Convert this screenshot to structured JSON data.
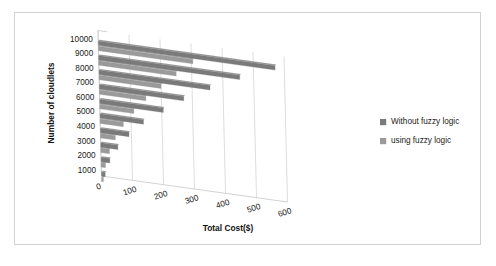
{
  "chart_data": {
    "type": "bar",
    "orientation": "horizontal",
    "style": "3d-perspective",
    "title": "",
    "xlabel": "Total Cost($)",
    "ylabel": "Number of cloudlets",
    "categories": [
      "1000",
      "2000",
      "3000",
      "4000",
      "5000",
      "6000",
      "7000",
      "8000",
      "9000",
      "10000"
    ],
    "xticks": [
      "0",
      "100",
      "200",
      "300",
      "400",
      "500",
      "600"
    ],
    "xlim": [
      0,
      600
    ],
    "grid": true,
    "legend_position": "right",
    "series": [
      {
        "name": "Without fuzzy logic",
        "color": "#7a7a7a",
        "values": [
          12,
          28,
          55,
          92,
          140,
          205,
          272,
          358,
          455,
          570
        ]
      },
      {
        "name": "using fuzzy logic",
        "color": "#9a9a9a",
        "values": [
          6,
          14,
          28,
          48,
          75,
          110,
          150,
          200,
          250,
          305
        ]
      }
    ]
  },
  "axes": {
    "y_title": "Number of cloudlets",
    "x_title": "Total Cost($)",
    "y_ticks": [
      "10000",
      "9000",
      "8000",
      "7000",
      "6000",
      "5000",
      "4000",
      "3000",
      "2000",
      "1000"
    ],
    "x_ticks": [
      "0",
      "100",
      "200",
      "300",
      "400",
      "500",
      "600"
    ]
  },
  "legend": {
    "items": [
      {
        "label": "Without fuzzy logic",
        "color": "#7a7a7a"
      },
      {
        "label": "using fuzzy logic",
        "color": "#9a9a9a"
      }
    ]
  },
  "colors": {
    "frame": "#d2d2d2",
    "grid": "#cfcfcf",
    "series_dark": "#7a7a7a",
    "series_light": "#9a9a9a",
    "text": "#1a1a1a",
    "background": "#ffffff"
  }
}
